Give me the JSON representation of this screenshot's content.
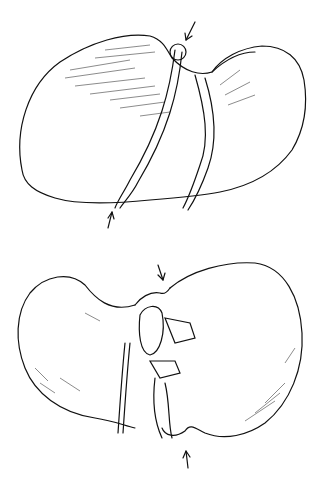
{
  "figure": {
    "type": "anatomical line illustration",
    "panels": [
      {
        "id": "top",
        "subject": "liver, superior (diaphragmatic) view",
        "arrows": 2
      },
      {
        "id": "bottom",
        "subject": "liver, inferior (visceral) view",
        "arrows": 2
      }
    ],
    "colors": {
      "background": "#ffffff",
      "ink": "#111111"
    }
  }
}
